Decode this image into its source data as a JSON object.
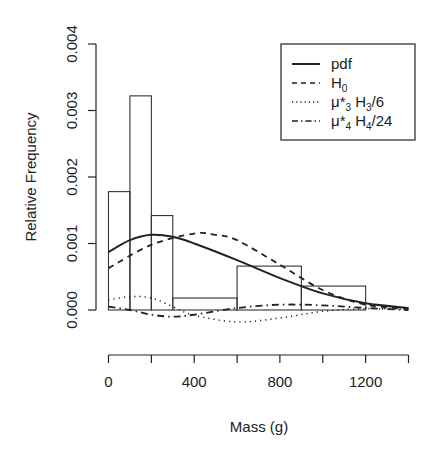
{
  "chart_data": {
    "type": "bar",
    "title": "",
    "xlabel": "Mass (g)",
    "ylabel": "Relative Frequency",
    "xlim": [
      0,
      1400
    ],
    "ylim": [
      0,
      0.004
    ],
    "x_ticks": [
      0,
      200,
      400,
      600,
      800,
      1000,
      1200,
      1400
    ],
    "x_tick_labels": [
      "0",
      "",
      "400",
      "",
      "800",
      "",
      "1200",
      ""
    ],
    "y_ticks": [
      0.0,
      0.001,
      0.002,
      0.003,
      0.004
    ],
    "y_tick_labels": [
      "0.000",
      "0.001",
      "0.002",
      "0.003",
      "0.004"
    ],
    "grid": false,
    "legend_position": "top-right",
    "histogram": {
      "bins": [
        [
          0,
          100
        ],
        [
          100,
          200
        ],
        [
          200,
          300
        ],
        [
          300,
          600
        ],
        [
          600,
          900
        ],
        [
          900,
          1200
        ]
      ],
      "values": [
        0.00178,
        0.00322,
        0.00142,
        0.00018,
        0.00066,
        0.00036
      ]
    },
    "series": [
      {
        "name": "pdf",
        "style": "solid",
        "x": [
          0,
          100,
          200,
          300,
          400,
          600,
          800,
          1000,
          1200,
          1400
        ],
        "values": [
          0.00087,
          0.00105,
          0.00113,
          0.0011,
          0.001,
          0.00075,
          0.00048,
          0.00025,
          0.0001,
          3e-05
        ]
      },
      {
        "name": "H0",
        "style": "dashed",
        "x": [
          0,
          200,
          400,
          500,
          600,
          800,
          1000,
          1200,
          1400
        ],
        "values": [
          0.00063,
          0.00098,
          0.00115,
          0.00113,
          0.00105,
          0.00068,
          0.0003,
          8e-05,
          2e-05
        ]
      },
      {
        "name": "μ*3 H3/6",
        "style": "dotted",
        "x": [
          0,
          100,
          200,
          300,
          400,
          600,
          800,
          1000,
          1200,
          1400
        ],
        "values": [
          0.00015,
          0.0002,
          0.00018,
          5e-05,
          -8e-05,
          -0.00018,
          -0.00012,
          -2e-05,
          2e-05,
          1e-05
        ]
      },
      {
        "name": "μ*4 H4/24",
        "style": "dotdash",
        "x": [
          0,
          100,
          200,
          300,
          400,
          600,
          800,
          1000,
          1200,
          1400
        ],
        "values": [
          5e-05,
          0.0,
          -7e-05,
          -0.0001,
          -7e-05,
          3e-05,
          8e-05,
          7e-05,
          3e-05,
          0.0
        ]
      }
    ]
  },
  "axes": {
    "xlabel": "Mass (g)",
    "ylabel": "Relative Frequency",
    "x_tick_labels": [
      "0",
      "400",
      "800",
      "1200"
    ],
    "y_tick_labels": [
      "0.000",
      "0.001",
      "0.002",
      "0.003",
      "0.004"
    ]
  },
  "legend": {
    "items": [
      {
        "main": "pdf",
        "sub": "",
        "rest": ""
      },
      {
        "main": "H",
        "sub": "0",
        "rest": ""
      },
      {
        "main": "μ*",
        "sub": "3",
        "rest": " H",
        "sub2": "3",
        "tail": "/6"
      },
      {
        "main": "μ*",
        "sub": "4",
        "rest": " H",
        "sub2": "4",
        "tail": "/24"
      }
    ]
  },
  "colors": {
    "line": "#222222",
    "background": "#ffffff"
  }
}
